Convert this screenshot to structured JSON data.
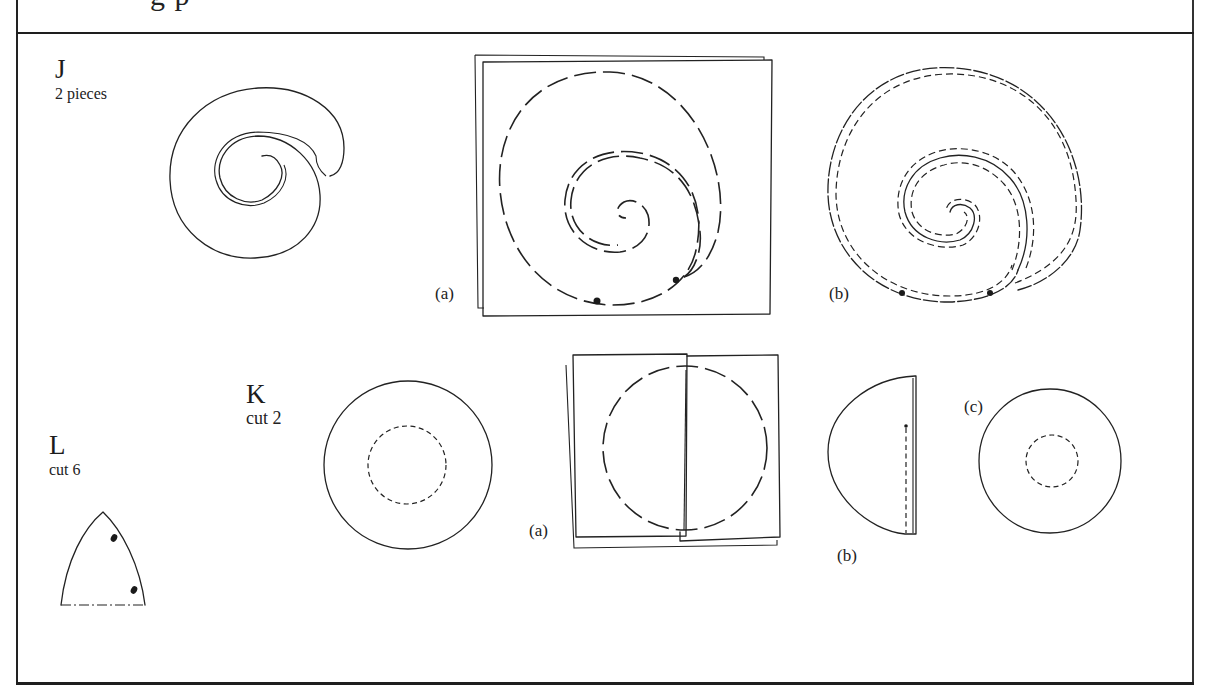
{
  "page": {
    "cut_off_heading": "g   p"
  },
  "sections": {
    "J": {
      "letter": "J",
      "quantity": "2 pieces",
      "steps": [
        {
          "label": "(a)"
        },
        {
          "label": "(b)"
        }
      ]
    },
    "K": {
      "letter": "K",
      "quantity": "cut 2",
      "steps": [
        {
          "label": "(a)"
        },
        {
          "label": "(b)"
        },
        {
          "label": "(c)"
        }
      ]
    },
    "L": {
      "letter": "L",
      "quantity": "cut 6"
    }
  },
  "colors": {
    "ink": "#222222",
    "paper": "#ffffff"
  }
}
